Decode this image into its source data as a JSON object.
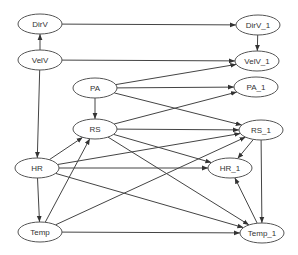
{
  "diagram": {
    "type": "dynamic-bayesian-network",
    "colors": {
      "node_stroke": "#555555",
      "edge": "#444444",
      "text": "#333333",
      "background": "#ffffff"
    },
    "nodes": [
      {
        "id": "DirV",
        "label": "DirV",
        "cx": 40,
        "cy": 24,
        "rx": 22,
        "ry": 10
      },
      {
        "id": "VelV",
        "label": "VelV",
        "cx": 40,
        "cy": 60,
        "rx": 22,
        "ry": 10
      },
      {
        "id": "PA",
        "label": "PA",
        "cx": 95,
        "cy": 88,
        "rx": 22,
        "ry": 10
      },
      {
        "id": "RS",
        "label": "RS",
        "cx": 95,
        "cy": 129,
        "rx": 22,
        "ry": 10
      },
      {
        "id": "HR",
        "label": "HR",
        "cx": 37,
        "cy": 168,
        "rx": 22,
        "ry": 10
      },
      {
        "id": "Temp",
        "label": "Temp",
        "cx": 40,
        "cy": 232,
        "rx": 22,
        "ry": 10
      },
      {
        "id": "DirV_1",
        "label": "DirV_1",
        "cx": 258,
        "cy": 25,
        "rx": 22,
        "ry": 10
      },
      {
        "id": "VelV_1",
        "label": "VelV_1",
        "cx": 257,
        "cy": 61,
        "rx": 22,
        "ry": 10
      },
      {
        "id": "PA_1",
        "label": "PA_1",
        "cx": 256,
        "cy": 87,
        "rx": 22,
        "ry": 10
      },
      {
        "id": "RS_1",
        "label": "RS_1",
        "cx": 261,
        "cy": 130,
        "rx": 22,
        "ry": 10
      },
      {
        "id": "HR_1",
        "label": "HR_1",
        "cx": 230,
        "cy": 168,
        "rx": 22,
        "ry": 10
      },
      {
        "id": "Temp_1",
        "label": "Temp_1",
        "cx": 262,
        "cy": 233,
        "rx": 22,
        "ry": 10
      }
    ],
    "edges": [
      {
        "from": "DirV",
        "to": "DirV_1"
      },
      {
        "from": "VelV",
        "to": "DirV"
      },
      {
        "from": "VelV",
        "to": "VelV_1"
      },
      {
        "from": "VelV",
        "to": "HR"
      },
      {
        "from": "PA",
        "to": "VelV_1"
      },
      {
        "from": "PA",
        "to": "PA_1"
      },
      {
        "from": "PA",
        "to": "RS_1"
      },
      {
        "from": "PA",
        "to": "RS"
      },
      {
        "from": "RS",
        "to": "PA_1"
      },
      {
        "from": "RS",
        "to": "RS_1"
      },
      {
        "from": "RS",
        "to": "HR_1"
      },
      {
        "from": "RS",
        "to": "Temp_1"
      },
      {
        "from": "HR",
        "to": "RS"
      },
      {
        "from": "HR",
        "to": "RS_1"
      },
      {
        "from": "HR",
        "to": "HR_1"
      },
      {
        "from": "HR",
        "to": "Temp_1"
      },
      {
        "from": "HR",
        "to": "Temp"
      },
      {
        "from": "Temp",
        "to": "RS"
      },
      {
        "from": "Temp",
        "to": "RS_1"
      },
      {
        "from": "Temp",
        "to": "Temp_1"
      },
      {
        "from": "DirV_1",
        "to": "VelV_1"
      },
      {
        "from": "RS_1",
        "to": "HR_1"
      },
      {
        "from": "RS_1",
        "to": "Temp_1"
      },
      {
        "from": "Temp_1",
        "to": "HR_1"
      }
    ]
  }
}
